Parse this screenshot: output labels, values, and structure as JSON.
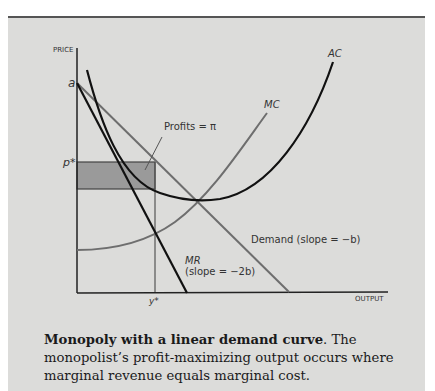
{
  "figure": {
    "axes": {
      "y_label": "PRICE",
      "x_label": "OUTPUT",
      "y_intercept_label": "a",
      "price_label": "p*",
      "output_label": "y*"
    },
    "curves": {
      "ac": "AC",
      "mc": "MC",
      "mr_name": "MR",
      "mr_slope": "(slope = −2b)",
      "demand": "Demand (slope = −b)"
    },
    "annotations": {
      "profits": "Profits = π"
    },
    "colors": {
      "background": "#dcdcda",
      "profit_area": "#9a9a9a",
      "black_curves": "#111111",
      "gray_curves": "#6e6e6e"
    }
  },
  "caption": {
    "title": "Monopoly with a linear demand curve",
    "text": ". The monopolist’s profit-maximizing output occurs where marginal revenue equals marginal cost."
  }
}
